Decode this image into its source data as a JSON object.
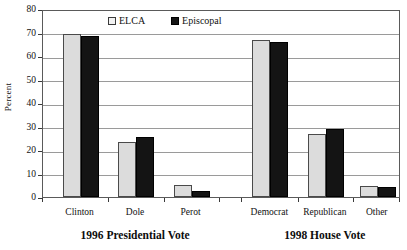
{
  "chart_data": {
    "type": "bar",
    "title": "",
    "xlabel": "",
    "ylabel": "Percent",
    "ylim": [
      0,
      80
    ],
    "yticks": [
      0,
      10,
      20,
      30,
      40,
      50,
      60,
      70,
      80
    ],
    "grid": true,
    "legend_position": "top-center",
    "categories": [
      "Clinton",
      "Dole",
      "Perot",
      "Democrat",
      "Republican",
      "Other"
    ],
    "groups": [
      {
        "title": "1996 Presidential Vote",
        "categories": [
          "Clinton",
          "Dole",
          "Perot"
        ]
      },
      {
        "title": "1998 House Vote",
        "categories": [
          "Democrat",
          "Republican",
          "Other"
        ]
      }
    ],
    "series": [
      {
        "name": "ELCA",
        "color": "#dcdcdc",
        "values": [
          69.5,
          23.2,
          5.0,
          67.0,
          27.0,
          4.5
        ]
      },
      {
        "name": "Episcopal",
        "color": "#141414",
        "values": [
          68.5,
          25.5,
          2.5,
          66.0,
          29.0,
          4.2
        ]
      }
    ]
  },
  "axis": {
    "y_title": "Percent",
    "y_tick_labels": [
      "0",
      "10",
      "20",
      "30",
      "40",
      "50",
      "60",
      "70",
      "80"
    ]
  },
  "legend": {
    "entries": [
      {
        "label": "ELCA",
        "swatch": "light-square-icon"
      },
      {
        "label": "Episcopal",
        "swatch": "dark-square-icon"
      }
    ]
  },
  "x_axis": {
    "labels": [
      "Clinton",
      "Dole",
      "Perot",
      "Democrat",
      "Republican",
      "Other"
    ]
  },
  "group_titles": [
    "1996 Presidential Vote",
    "1998 House Vote"
  ]
}
